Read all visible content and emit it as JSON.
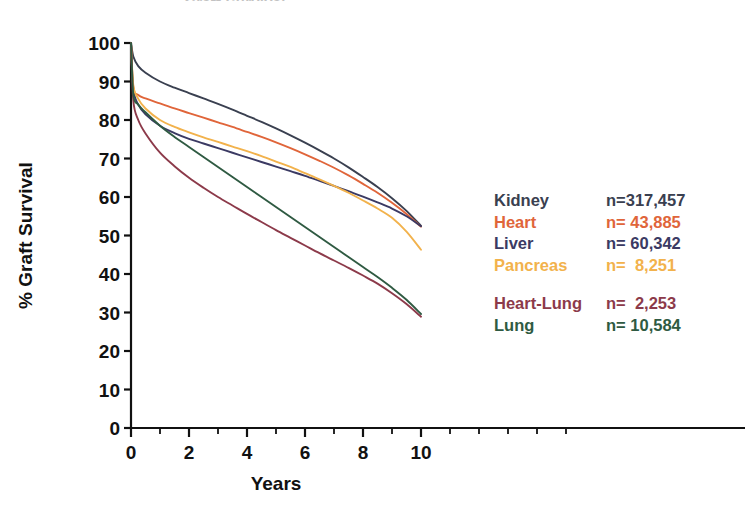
{
  "chart_data": {
    "type": "line",
    "title": "Graft Survival",
    "xlabel": "Years",
    "ylabel": "% Graft Survival",
    "xlim": [
      0,
      10
    ],
    "ylim": [
      0,
      100
    ],
    "xticks": [
      0,
      2,
      4,
      6,
      8,
      10
    ],
    "xticks_labels": [
      "0",
      "2",
      "4",
      "6",
      "8",
      "10"
    ],
    "xminor_ticks": [
      1,
      3,
      5,
      7,
      9
    ],
    "yticks": [
      0,
      10,
      20,
      30,
      40,
      50,
      60,
      70,
      80,
      90,
      100
    ],
    "yticks_labels": [
      "0",
      "10",
      "20",
      "30",
      "40",
      "50",
      "60",
      "70",
      "80",
      "90",
      "100"
    ],
    "grid": false,
    "legend_position": "right",
    "x": [
      0,
      0.08,
      0.25,
      0.5,
      1,
      1.5,
      2,
      2.5,
      3,
      3.5,
      4,
      4.5,
      5,
      5.5,
      6,
      6.5,
      7,
      7.5,
      8,
      8.5,
      9,
      9.5,
      10
    ],
    "series": [
      {
        "name": "Kidney",
        "n_label": "n=317,457",
        "n_value": 317457,
        "color": "#3a4050",
        "values": [
          100,
          96.5,
          94.0,
          92.3,
          90.0,
          88.4,
          87.0,
          85.6,
          84.2,
          82.7,
          81.1,
          79.5,
          77.8,
          76.0,
          74.1,
          72.1,
          70.0,
          67.7,
          65.2,
          62.6,
          59.7,
          56.4,
          52.5
        ]
      },
      {
        "name": "Heart",
        "n_label": "n= 43,885",
        "n_value": 43885,
        "color": "#e0653a",
        "values": [
          100,
          88.5,
          86.5,
          85.6,
          84.3,
          83.0,
          81.8,
          80.6,
          79.4,
          78.2,
          76.9,
          75.6,
          74.2,
          72.7,
          71.1,
          69.4,
          67.6,
          65.6,
          63.4,
          61.1,
          58.5,
          55.6,
          52.3
        ]
      },
      {
        "name": "Liver",
        "n_label": "n= 60,342",
        "n_value": 60342,
        "color": "#3b3a63",
        "values": [
          100,
          88.0,
          84.0,
          81.5,
          78.5,
          76.6,
          75.1,
          73.9,
          72.7,
          71.5,
          70.3,
          69.1,
          67.9,
          66.7,
          65.5,
          64.2,
          62.9,
          61.5,
          60.1,
          58.6,
          57.0,
          55.0,
          52.4
        ]
      },
      {
        "name": "Pancreas",
        "n_label": "n=  8,251",
        "n_value": 8251,
        "color": "#f2b24c",
        "values": [
          100,
          89.0,
          85.5,
          83.0,
          80.0,
          78.2,
          76.8,
          75.5,
          74.3,
          73.1,
          71.9,
          70.6,
          69.2,
          67.8,
          66.2,
          64.6,
          62.9,
          61.1,
          59.1,
          57.0,
          54.6,
          51.0,
          46.3
        ]
      },
      {
        "name": "Heart-Lung",
        "n_label": "n=  2,253",
        "n_value": 2253,
        "color": "#8c3a4a",
        "values": [
          100,
          85.0,
          80.0,
          76.5,
          71.5,
          68.0,
          65.0,
          62.4,
          60.0,
          57.8,
          55.6,
          53.5,
          51.4,
          49.4,
          47.4,
          45.4,
          43.5,
          41.6,
          39.6,
          37.5,
          35.0,
          32.2,
          28.9
        ]
      },
      {
        "name": "Lung",
        "n_label": "n= 10,584",
        "n_value": 10584,
        "color": "#2f5a42",
        "values": [
          100,
          86.5,
          84.0,
          82.0,
          78.5,
          75.6,
          73.0,
          70.4,
          67.8,
          65.2,
          62.6,
          60.0,
          57.4,
          54.8,
          52.2,
          49.6,
          47.0,
          44.4,
          41.8,
          39.2,
          36.4,
          33.3,
          29.6
        ]
      }
    ]
  },
  "legend": {
    "rows": [
      {
        "name": "Kidney",
        "n": "n=317,457",
        "color": "#3a4050",
        "gap": false
      },
      {
        "name": "Heart",
        "n": "n= 43,885",
        "color": "#e0653a",
        "gap": false
      },
      {
        "name": "Liver",
        "n": "n= 60,342",
        "color": "#3b3a63",
        "gap": false
      },
      {
        "name": "Pancreas",
        "n": "n=  8,251",
        "color": "#f2b24c",
        "gap": false
      },
      {
        "name": "Heart-Lung",
        "n": "n=  2,253",
        "color": "#8c3a4a",
        "gap": true
      },
      {
        "name": "Lung",
        "n": "n= 10,584",
        "color": "#2f5a42",
        "gap": false
      }
    ]
  }
}
